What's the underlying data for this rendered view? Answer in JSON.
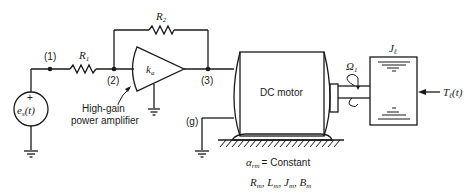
{
  "diagram": {
    "type": "circuit-and-mechanical-schematic",
    "nodes": {
      "n1": "(1)",
      "n2": "(2)",
      "n3": "(3)",
      "ng": "(g)"
    },
    "components": {
      "source": {
        "label_main": "e",
        "label_sub": "s",
        "label_arg": "(t)",
        "polarity": "+"
      },
      "r1": {
        "label_main": "R",
        "label_sub": "1"
      },
      "r2": {
        "label_main": "R",
        "label_sub": "2"
      },
      "amplifier": {
        "label_main": "k",
        "label_sub": "a",
        "caption_line1": "High-gain",
        "caption_line2": "power amplifier"
      },
      "motor": {
        "label": "DC motor"
      },
      "speed": {
        "label_main": "Ω",
        "label_sub": "1"
      },
      "load_inertia": {
        "label_main": "J",
        "label_sub": "ℓ"
      },
      "load_torque": {
        "label_main": "T",
        "label_sub": "ℓ",
        "label_arg": "(t)"
      }
    },
    "annotations": {
      "alpha_main": "α",
      "alpha_sub": "rm",
      "alpha_eq": "= Constant",
      "params_line": "Rm, Lm, Jm, Bm",
      "params": [
        {
          "main": "R",
          "sub": "m"
        },
        {
          "main": "L",
          "sub": "m"
        },
        {
          "main": "J",
          "sub": "m"
        },
        {
          "main": "B",
          "sub": "m"
        }
      ]
    }
  }
}
